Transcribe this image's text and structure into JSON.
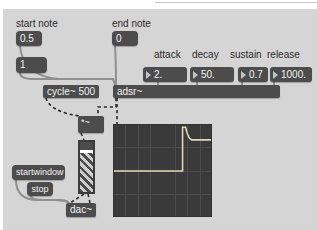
{
  "colors": {
    "patch_background": "#d5d5d5",
    "box_fill": "#4c4c4c",
    "box_text": "#f2f2f2",
    "label_text": "#2b2b2b",
    "message_cord": "#909090",
    "signal_cord": "#2e2e2e",
    "scope_background": "#3a3a3a",
    "scope_grid": "#4d4d4d",
    "scope_trace": "#ded9be"
  },
  "labels": {
    "start_note": "start note",
    "end_note": "end note"
  },
  "message_boxes": {
    "start_value": "0.5",
    "velocity": "1",
    "end_value": "0",
    "startwindow": "startwindow",
    "stop": "stop"
  },
  "object_boxes": {
    "oscillator": "cycle~ 500",
    "envelope": "adsr~",
    "multiplier": "*~",
    "output": "dac~"
  },
  "envelope_params": {
    "items": [
      {
        "label": "attack",
        "value": "2."
      },
      {
        "label": "decay",
        "value": "50."
      },
      {
        "label": "sustain",
        "value": "0.7"
      },
      {
        "label": "release",
        "value": "1000."
      }
    ]
  },
  "scope": {
    "grid_cols": 8,
    "grid_rows": 4,
    "description": "ADSR envelope: 0 until note-on at 70% of sweep, instant attack to 1.0, decay to sustain 0.7 held to end",
    "trace_points": [
      [
        0,
        0.505
      ],
      [
        0.707,
        0.505
      ],
      [
        0.707,
        0.025
      ],
      [
        0.737,
        0.025
      ],
      [
        0.755,
        0.09
      ],
      [
        0.775,
        0.14
      ],
      [
        0.8,
        0.163
      ],
      [
        1,
        0.163
      ]
    ]
  }
}
